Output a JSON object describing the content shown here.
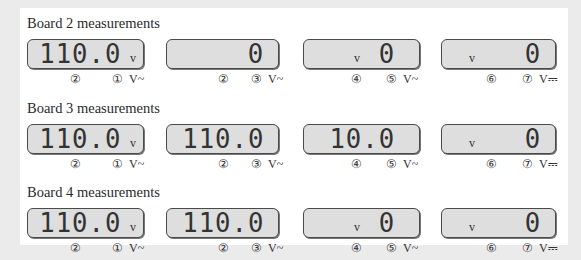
{
  "boards": [
    {
      "title": "Board 2 measurements",
      "meters": [
        {
          "reading": "110.0",
          "unit": "v",
          "labels": [
            "②",
            "①"
          ],
          "mode": "V~"
        },
        {
          "reading": "0",
          "unit": "",
          "labels": [
            "②",
            "③"
          ],
          "mode": "V~"
        },
        {
          "reading": "0",
          "unit": "v",
          "labels": [
            "④",
            "⑤"
          ],
          "mode": "V~"
        },
        {
          "reading": "0",
          "unit": "v",
          "labels": [
            "⑥",
            "⑦"
          ],
          "mode": "V⎓"
        }
      ]
    },
    {
      "title": "Board 3 measurements",
      "meters": [
        {
          "reading": "110.0",
          "unit": "v",
          "labels": [
            "②",
            "①"
          ],
          "mode": "V~"
        },
        {
          "reading": "110.0",
          "unit": "",
          "labels": [
            "②",
            "③"
          ],
          "mode": "V~"
        },
        {
          "reading": "10.0",
          "unit": "",
          "labels": [
            "④",
            "⑤"
          ],
          "mode": "V~"
        },
        {
          "reading": "0",
          "unit": "v",
          "labels": [
            "⑥",
            "⑦"
          ],
          "mode": "V⎓"
        }
      ]
    },
    {
      "title": "Board 4 measurements",
      "meters": [
        {
          "reading": "110.0",
          "unit": "v",
          "labels": [
            "②",
            "①"
          ],
          "mode": "V~"
        },
        {
          "reading": "110.0",
          "unit": "",
          "labels": [
            "②",
            "③"
          ],
          "mode": "V~"
        },
        {
          "reading": "0",
          "unit": "v",
          "labels": [
            "④",
            "⑤"
          ],
          "mode": "V~"
        },
        {
          "reading": "0",
          "unit": "v",
          "labels": [
            "⑥",
            "⑦"
          ],
          "mode": "V⎓"
        }
      ]
    }
  ],
  "colors": {
    "page_background": "#ebebeb",
    "panel_background": "#ffffff",
    "lcd_background": "#dedede",
    "lcd_border": "#4a4a4a",
    "text": "#2a2a2a"
  }
}
